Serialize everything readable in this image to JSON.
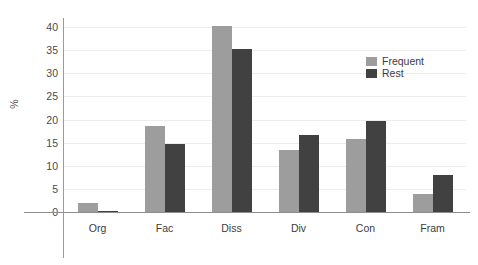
{
  "chart_data": {
    "type": "bar",
    "title": "",
    "subtitle": "",
    "xlabel": "",
    "ylabel": "%",
    "categories": [
      "Org",
      "Fac",
      "Diss",
      "Div",
      "Con",
      "Fram"
    ],
    "series": [
      {
        "name": "Frequent",
        "color": "#9d9d9d",
        "values": [
          2.0,
          18.5,
          40.3,
          13.5,
          15.7,
          4.0
        ]
      },
      {
        "name": "Rest",
        "color": "#414141",
        "values": [
          0.3,
          14.8,
          35.3,
          16.7,
          19.6,
          8.0
        ]
      }
    ],
    "ylim": [
      0,
      41
    ],
    "y_ticks": [
      0,
      5,
      10,
      15,
      20,
      25,
      30,
      35,
      40
    ],
    "y_tick_labels": [
      "0",
      "5",
      "10",
      "15",
      "20",
      "25",
      "30",
      "35",
      "40"
    ],
    "grid": true,
    "grid_axis": "y",
    "legend_position": "top-right",
    "legend_entries": [
      "Frequent",
      "Rest"
    ],
    "background": "#ffffff",
    "axis_color": "#8e8e8e",
    "grid_color": "#ececec"
  }
}
